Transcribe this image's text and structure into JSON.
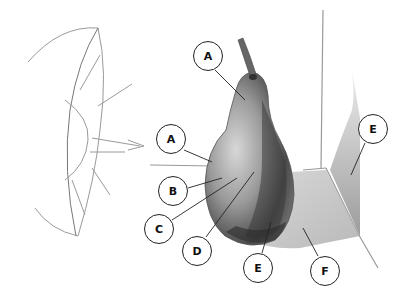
{
  "figure": {
    "light_source": "sun-icon",
    "labels": [
      {
        "id": "label-a-top",
        "text": "A",
        "x": 208,
        "y": 56,
        "tx": 245,
        "ty": 100
      },
      {
        "id": "label-a-left",
        "text": "A",
        "x": 171,
        "y": 139,
        "tx": 212,
        "ty": 162
      },
      {
        "id": "label-b",
        "text": "B",
        "x": 173,
        "y": 191,
        "tx": 222,
        "ty": 178
      },
      {
        "id": "label-c",
        "text": "C",
        "x": 159,
        "y": 229,
        "tx": 237,
        "ty": 178
      },
      {
        "id": "label-d",
        "text": "D",
        "x": 197,
        "y": 251,
        "tx": 254,
        "ty": 172
      },
      {
        "id": "label-e-bottom",
        "text": "E",
        "x": 258,
        "y": 268,
        "tx": 271,
        "ty": 222
      },
      {
        "id": "label-f",
        "text": "F",
        "x": 325,
        "y": 271,
        "tx": 303,
        "ty": 228
      },
      {
        "id": "label-e-right",
        "text": "E",
        "x": 373,
        "y": 129,
        "tx": 351,
        "ty": 175
      }
    ]
  }
}
